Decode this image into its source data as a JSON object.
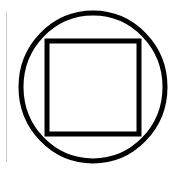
{
  "diagram": {
    "title": "",
    "shapes": [
      {
        "type": "circle",
        "label": "outer-circle",
        "cx": 93,
        "cy": 87,
        "rx": 72,
        "ry": 74,
        "stroke": "#000000",
        "stroke_width": 5
      },
      {
        "type": "square",
        "label": "inscribed-square",
        "x": 47,
        "y": 41,
        "width": 92,
        "height": 93,
        "stroke": "#000000",
        "stroke_width": 5
      }
    ],
    "margin_line": {
      "x": 6,
      "y1": 12,
      "y2": 162,
      "color": "#c8c8c8"
    },
    "background": "#ffffff"
  }
}
